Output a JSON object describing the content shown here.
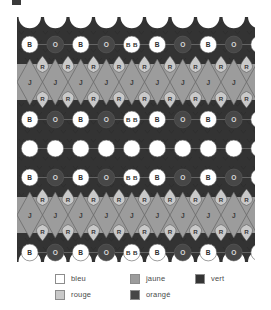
{
  "figure": {
    "type": "tessellation-colouring-diagram",
    "artifact_mark": ""
  },
  "palette": {
    "bleu": "#ffffff",
    "rouge": "#c9c9c9",
    "jaune": "#9c9c9c",
    "orange": "#474747",
    "vert": "#343434",
    "outline": "#5a5a5a",
    "legend_text": "#4a4a4a",
    "legend_border": "#8c8c8c"
  },
  "pattern": {
    "columns": 10,
    "cell_width": 25.5,
    "rows": [
      {
        "id": "row-circles-1",
        "kind": "circle-row",
        "y": 23,
        "labels": [
          "B",
          "O",
          "B",
          "O",
          "BB",
          "B",
          "O",
          "B",
          "O",
          "B"
        ],
        "fills": [
          "bleu",
          "orange",
          "bleu",
          "orange",
          "bleu",
          "bleu",
          "orange",
          "bleu",
          "orange",
          "bleu"
        ]
      },
      {
        "id": "band-jaune-1",
        "kind": "diamond-band",
        "y": 44,
        "top_labels": [
          "R",
          "R",
          "R",
          "R",
          "R",
          "R",
          "R",
          "R",
          "R",
          "R"
        ],
        "center_labels": [
          "J",
          "J",
          "J",
          "J",
          "J",
          "J",
          "J",
          "J",
          "J",
          "J"
        ],
        "bottom_labels": [
          "R",
          "R",
          "R",
          "R",
          "R",
          "R",
          "R",
          "R",
          "R",
          "R"
        ]
      },
      {
        "id": "row-circles-2",
        "kind": "circle-row",
        "y": 98,
        "labels": [
          "B",
          "O",
          "B",
          "O",
          "BB",
          "B",
          "O",
          "B",
          "O",
          "B"
        ],
        "fills": [
          "bleu",
          "orange",
          "bleu",
          "orange",
          "bleu",
          "bleu",
          "orange",
          "bleu",
          "orange",
          "bleu"
        ]
      },
      {
        "id": "row-circles-blank",
        "kind": "circle-row",
        "y": 127,
        "labels": [
          "",
          "",
          "",
          "",
          "",
          "",
          "",
          "",
          "",
          ""
        ],
        "fills": [
          "bleu",
          "bleu",
          "bleu",
          "bleu",
          "bleu",
          "bleu",
          "bleu",
          "bleu",
          "bleu",
          "bleu"
        ]
      },
      {
        "id": "row-circles-3",
        "kind": "circle-row",
        "y": 156,
        "labels": [
          "B",
          "O",
          "B",
          "O",
          "BB",
          "B",
          "O",
          "B",
          "O",
          "B"
        ],
        "fills": [
          "bleu",
          "orange",
          "bleu",
          "orange",
          "bleu",
          "bleu",
          "orange",
          "bleu",
          "orange",
          "bleu"
        ]
      },
      {
        "id": "band-jaune-2",
        "kind": "diamond-band",
        "y": 177,
        "top_labels": [
          "R",
          "R",
          "R",
          "R",
          "R",
          "R",
          "R",
          "R",
          "R",
          "R"
        ],
        "center_labels": [
          "J",
          "J",
          "J",
          "J",
          "J",
          "J",
          "J",
          "J",
          "J",
          "J"
        ],
        "bottom_labels": [
          "R",
          "R",
          "R",
          "R",
          "R",
          "R",
          "R",
          "R",
          "R",
          "R"
        ]
      },
      {
        "id": "row-circles-4",
        "kind": "circle-row",
        "y": 231,
        "labels": [
          "B",
          "O",
          "B",
          "O",
          "BB",
          "B",
          "O",
          "B",
          "O",
          "B"
        ],
        "fills": [
          "bleu",
          "orange",
          "bleu",
          "orange",
          "bleu",
          "bleu",
          "orange",
          "bleu",
          "orange",
          "bleu"
        ]
      }
    ]
  },
  "legend": {
    "columns": [
      {
        "items": [
          {
            "label": "bleu",
            "swatch": "bleu"
          },
          {
            "label": "rouge",
            "swatch": "rouge"
          }
        ]
      },
      {
        "items": [
          {
            "label": "jaune",
            "swatch": "jaune"
          },
          {
            "label": "orangé",
            "swatch": "orange"
          }
        ]
      },
      {
        "items": [
          {
            "label": "vert",
            "swatch": "vert"
          }
        ]
      }
    ]
  }
}
